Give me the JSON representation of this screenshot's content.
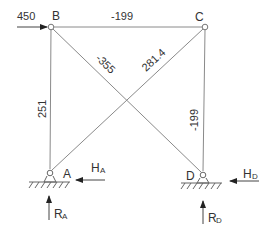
{
  "diagram": {
    "type": "truss",
    "nodes": [
      {
        "id": "A",
        "label": "A",
        "x": 50,
        "y": 172,
        "support": "pin"
      },
      {
        "id": "B",
        "label": "B",
        "x": 51,
        "y": 27
      },
      {
        "id": "C",
        "label": "C",
        "x": 205,
        "y": 27
      },
      {
        "id": "D",
        "label": "D",
        "x": 203,
        "y": 174,
        "support": "pin"
      }
    ],
    "members": [
      {
        "id": "AB",
        "from": "A",
        "to": "B",
        "force": "251"
      },
      {
        "id": "BC",
        "from": "B",
        "to": "C",
        "force": "-199"
      },
      {
        "id": "CD",
        "from": "C",
        "to": "D",
        "force": "-199"
      },
      {
        "id": "BD",
        "from": "B",
        "to": "D",
        "force": "-355"
      },
      {
        "id": "AC",
        "from": "A",
        "to": "C",
        "force": "281.4"
      }
    ],
    "loads": [
      {
        "id": "P",
        "at": "B",
        "label": "450",
        "direction": "right"
      }
    ],
    "reactions": [
      {
        "id": "HA",
        "label_main": "H",
        "label_sub": "A",
        "direction": "left"
      },
      {
        "id": "RA",
        "label_main": "R",
        "label_sub": "A",
        "direction": "up"
      },
      {
        "id": "HD",
        "label_main": "H",
        "label_sub": "D",
        "direction": "left"
      },
      {
        "id": "RD",
        "label_main": "R",
        "label_sub": "D",
        "direction": "up"
      }
    ],
    "colors": {
      "line": "#8a8a8a",
      "text": "#333333",
      "arrow": "#222222"
    }
  }
}
